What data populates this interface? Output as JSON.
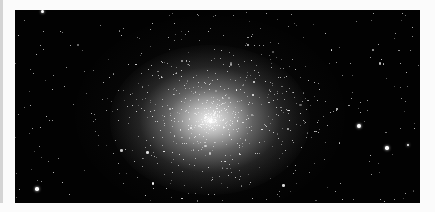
{
  "image": {
    "subject": "Globular star cluster",
    "description": "Dense spherical cluster of stars with bright white core on black sky background, scattered field stars"
  },
  "colors": {
    "background": "#fbfbfb",
    "sky": "#020202",
    "core": "#ffffff",
    "edge_bar": "#d4d4d4"
  }
}
